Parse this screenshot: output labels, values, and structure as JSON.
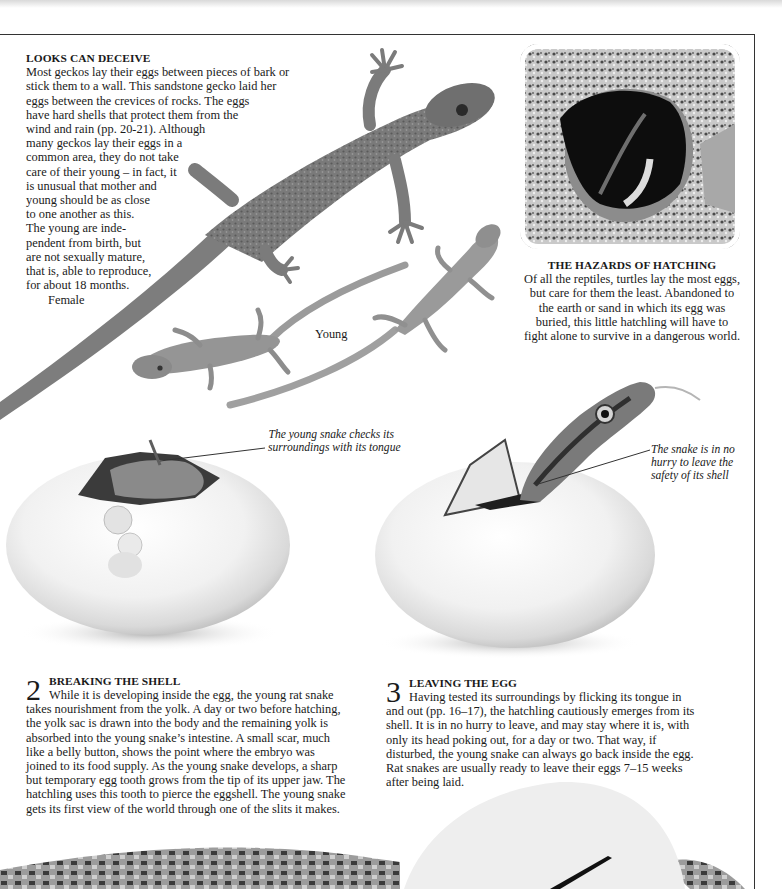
{
  "page": {
    "gecko_section": {
      "heading": "LOOKS CAN DECEIVE",
      "lines": [
        "Most geckos lay their eggs between pieces of bark or",
        "stick them to a wall. This sandstone gecko laid her",
        "eggs between the crevices of rocks. The eggs",
        "have hard shells that protect them from the",
        "wind and rain (pp. 20-21). Although",
        "many geckos lay their eggs in a",
        "common area, they do not take",
        "care of their young – in fact, it",
        "is unusual that mother and",
        "young should be as close",
        "to one another as this.",
        "The young are inde-",
        "pendent from birth, but",
        "are not sexually mature,",
        "that is, able to reproduce,",
        "for about 18 months."
      ],
      "labels": {
        "female": "Female",
        "young": "Young"
      }
    },
    "turtle_section": {
      "heading": "THE HAZARDS OF HATCHING",
      "lines": [
        "Of all the reptiles, turtles lay the most eggs,",
        "but care for them the least. Abandoned to",
        "the earth or sand in which its egg was",
        "buried, this little hatchling will have to",
        "fight alone to survive in a dangerous world."
      ]
    },
    "callouts": {
      "left": [
        "The young snake checks its",
        "surroundings with its tongue"
      ],
      "right": [
        "The snake is in no",
        "hurry to leave the",
        "safety of its shell"
      ]
    },
    "steps": [
      {
        "number": "2",
        "heading": "BREAKING THE SHELL",
        "lines": [
          "While it is developing inside the egg, the young rat snake",
          "takes nourishment from the yolk. A day or two before hatching,",
          "the yolk sac is drawn into the body and the remaining yolk is",
          "absorbed into the young snake’s intestine. A small scar, much",
          "like a belly button, shows the point where the embryo was",
          "joined to its food supply. As the young snake develops, a sharp",
          "but temporary egg tooth grows from the tip of its upper jaw. The",
          "hatchling uses this tooth to pierce the eggshell. The young snake",
          "gets its first view of the world through one of the slits it makes."
        ]
      },
      {
        "number": "3",
        "heading": "LEAVING THE EGG",
        "lines": [
          "Having tested its surroundings by flicking its tongue in",
          "and out (pp. 16–17), the hatchling cautiously emerges from its",
          "shell. It is in no hurry to leave, and may stay where it is, with",
          "only its head poking out, for a day or two. That way, if",
          "disturbed, the young snake can always go back inside the egg.",
          "Rat snakes are usually ready to leave their eggs 7–15 weeks",
          "after being laid."
        ]
      }
    ],
    "images": {
      "adult_gecko": "female sandstone gecko photo",
      "young_geckos": "two young gecko photos",
      "turtle": "turtle hatchling in egg photo",
      "egg_breaking": "rat snake egg breaking photo",
      "egg_leaving": "rat snake leaving egg photo",
      "bottom": "snake coiled around egg photo"
    }
  }
}
